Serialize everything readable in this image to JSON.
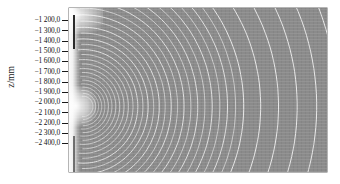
{
  "figure": {
    "type": "contour-field-plot",
    "background_color": "#8b8b8b",
    "contour_color": "#e9e9e9",
    "axis_text_color": "#111111"
  },
  "yaxis": {
    "title": "z/mm",
    "tick_labels": [
      "−1 200,0",
      "−1 300,0",
      "−1 400,0",
      "−1 500,0",
      "−1 600,0",
      "−1 700,0",
      "−1 800,0",
      "−1 900,0",
      "−2 000,0",
      "−2 100,0",
      "−2 200,0",
      "−2 300,0",
      "−2 400,0"
    ]
  },
  "chart_data": {
    "type": "heatmap",
    "title": "",
    "xlabel": "",
    "ylabel": "z/mm",
    "grid": false,
    "legend": "none",
    "ylim": [
      -2450,
      -1150
    ],
    "ytick_values": [
      -1200,
      -1300,
      -1400,
      -1500,
      -1600,
      -1700,
      -1800,
      -1900,
      -2000,
      -2100,
      -2200,
      -2300,
      -2400
    ],
    "ytick_labels": [
      "−1 200,0",
      "−1 300,0",
      "−1 400,0",
      "−1 500,0",
      "−1 600,0",
      "−1 700,0",
      "−1 800,0",
      "−1 900,0",
      "−2 000,0",
      "−2 100,0",
      "−2 200,0",
      "−2 300,0",
      "−2 400,0"
    ],
    "source_point_normalized": [
      0.055,
      0.6
    ],
    "contour_family": "concentric circular arcs",
    "contour_count": 24,
    "contour_radii_normalized": [
      0.035,
      0.055,
      0.078,
      0.103,
      0.131,
      0.162,
      0.196,
      0.233,
      0.273,
      0.316,
      0.362,
      0.411,
      0.463,
      0.518,
      0.576,
      0.637,
      0.701,
      0.768,
      0.838,
      0.911,
      0.987,
      1.066,
      1.148,
      1.233
    ],
    "background_value": "uniform mid-grey",
    "colormap": "greyscale"
  }
}
